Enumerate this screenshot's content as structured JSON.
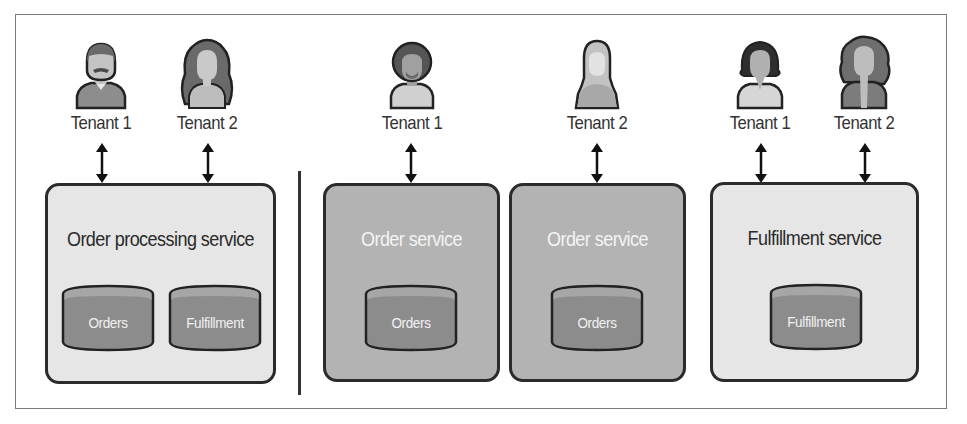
{
  "diagram": {
    "left_panel": {
      "tenants": [
        {
          "label": "Tenant 1",
          "avatar": "man-mustache"
        },
        {
          "label": "Tenant 2",
          "avatar": "woman-long-hair"
        }
      ],
      "service": {
        "title": "Order processing service",
        "databases": [
          "Orders",
          "Fulfillment"
        ]
      }
    },
    "right_panel": {
      "order_group": {
        "tenants": [
          {
            "label": "Tenant 1",
            "avatar": "man-afro-beard"
          },
          {
            "label": "Tenant 2",
            "avatar": "woman-hijab"
          }
        ],
        "services": [
          {
            "title": "Order service",
            "databases": [
              "Orders"
            ]
          },
          {
            "title": "Order service",
            "databases": [
              "Orders"
            ]
          }
        ]
      },
      "fulfillment_group": {
        "tenants": [
          {
            "label": "Tenant 1",
            "avatar": "woman-bob-hair"
          },
          {
            "label": "Tenant 2",
            "avatar": "woman-curly-hair"
          }
        ],
        "service": {
          "title": "Fulfillment service",
          "databases": [
            "Fulfillment"
          ]
        }
      }
    },
    "colors": {
      "outline": "#2b2b2b",
      "light_box": "#e6e6e6",
      "dark_box": "#b3b3b3",
      "db_body": "#8c8c8c",
      "db_top": "#a6a6a6"
    }
  }
}
